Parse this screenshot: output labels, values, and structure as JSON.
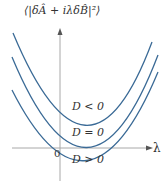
{
  "figure": {
    "y_axis_label": "⟨|δÂ + iλδB̂|²⟩",
    "x_axis_label": "λ",
    "origin_label": "0",
    "curves": [
      {
        "label": "D < 0",
        "color": "#3a6a96"
      },
      {
        "label": "D = 0",
        "color": "#3a6a96"
      },
      {
        "label": "D > 0",
        "color": "#3a6a96"
      }
    ],
    "axis_color": "#a0a0a0"
  }
}
